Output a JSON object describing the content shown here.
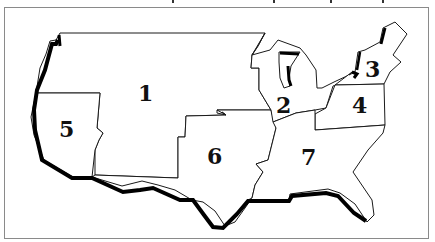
{
  "map": {
    "title_fragment": "",
    "regions": [
      {
        "id": "1",
        "label": "1"
      },
      {
        "id": "2",
        "label": "2"
      },
      {
        "id": "3",
        "label": "3"
      },
      {
        "id": "4",
        "label": "4"
      },
      {
        "id": "5",
        "label": "5"
      },
      {
        "id": "6",
        "label": "6"
      },
      {
        "id": "7",
        "label": "7"
      }
    ],
    "colors": {
      "border": "#1a1a1a",
      "coastline": "#000000",
      "fill": "#ffffff",
      "frame": "#8a8a8a"
    }
  }
}
